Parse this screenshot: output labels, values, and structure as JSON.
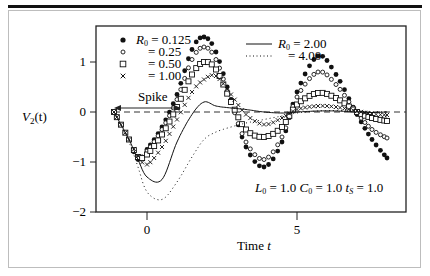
{
  "chart_data": {
    "type": "line",
    "title": "",
    "xlabel": "Time t",
    "ylabel": "V2(t)",
    "xlim": [
      -1.7,
      8.63
    ],
    "ylim": [
      -2,
      1.72
    ],
    "x_ticks": [
      0,
      5
    ],
    "y_ticks": [
      1,
      0,
      -1,
      -2
    ],
    "x_tick_labels": [
      "0",
      "5"
    ],
    "y_tick_labels": [
      "1",
      "0",
      "−1",
      "−2"
    ],
    "grid": false,
    "reference_line": {
      "y": 0,
      "style": "dashed"
    },
    "annotations": [
      {
        "text": "Spike",
        "type": "double-arrow",
        "from_t": -1.1,
        "to_t": 1.0,
        "y": 0.12
      },
      {
        "text": "L0 = 1.0  C0 = 1.0  tS = 1.0",
        "position": "lower-right"
      }
    ],
    "legend": [
      {
        "label": "R0 = 0.125",
        "marker": "filled-circle"
      },
      {
        "label": "= 0.25",
        "marker": "open-circle"
      },
      {
        "label": "= 0.50",
        "marker": "open-square"
      },
      {
        "label": "= 1.00",
        "marker": "cross"
      },
      {
        "label": "R0 = 2.00",
        "marker": "solid-line"
      },
      {
        "label": "= 4.00",
        "marker": "dotted-line"
      }
    ],
    "x": [
      -1.1,
      -0.6,
      -0.3,
      0.0,
      0.5,
      1.0,
      1.5,
      1.9,
      2.3,
      2.8,
      3.3,
      3.9,
      4.5,
      5.0,
      5.7,
      6.3,
      7.0,
      7.5,
      8.0
    ],
    "series": [
      {
        "name": "R0 = 0.125",
        "marker": "filled-circle",
        "values": [
          0.0,
          -0.55,
          -0.95,
          -0.75,
          -0.3,
          0.35,
          1.25,
          1.5,
          1.2,
          0.25,
          -0.7,
          -1.1,
          -0.6,
          0.4,
          1.12,
          0.75,
          -0.05,
          -0.55,
          -0.92
        ]
      },
      {
        "name": "R0 = 0.25",
        "marker": "open-circle",
        "values": [
          0.0,
          -0.55,
          -0.92,
          -0.78,
          -0.35,
          0.25,
          1.05,
          1.3,
          1.05,
          0.2,
          -0.6,
          -0.95,
          -0.5,
          0.3,
          0.8,
          0.55,
          -0.02,
          -0.35,
          -0.52
        ]
      },
      {
        "name": "R0 = 0.50",
        "marker": "open-square",
        "values": [
          0.0,
          -0.55,
          -0.9,
          -0.85,
          -0.45,
          0.1,
          0.75,
          1.0,
          0.85,
          0.2,
          -0.35,
          -0.5,
          -0.3,
          0.15,
          0.38,
          0.28,
          0.0,
          -0.12,
          -0.18
        ]
      },
      {
        "name": "R0 = 1.00",
        "marker": "cross",
        "values": [
          0.0,
          -0.55,
          -0.88,
          -1.05,
          -0.7,
          -0.15,
          0.4,
          0.65,
          0.72,
          0.35,
          -0.05,
          -0.25,
          -0.12,
          0.05,
          0.12,
          0.1,
          0.02,
          -0.04,
          -0.06
        ]
      },
      {
        "name": "R0 = 2.00",
        "marker": "solid-line",
        "values": [
          0.0,
          -0.55,
          -0.95,
          -1.3,
          -1.35,
          -0.6,
          -0.05,
          0.2,
          0.12,
          0.08,
          0.05,
          0.0,
          -0.02,
          0.0,
          0.02,
          0.02,
          0.0,
          -0.01,
          0.0
        ]
      },
      {
        "name": "R0 = 4.00",
        "marker": "dotted-line",
        "values": [
          0.0,
          -0.6,
          -1.1,
          -1.6,
          -1.75,
          -1.4,
          -0.9,
          -0.55,
          -0.4,
          -0.3,
          -0.22,
          -0.15,
          -0.08,
          -0.02,
          0.02,
          0.03,
          0.02,
          0.01,
          0.0
        ]
      }
    ]
  },
  "labels": {
    "ylabel_main": "V",
    "ylabel_sub": "2",
    "ylabel_suffix": "(t)",
    "xlabel_main": "Time ",
    "xlabel_var": "t",
    "spike": "Spike",
    "params": "L0 = 1.0  C0 = 1.0  tS = 1.0"
  }
}
